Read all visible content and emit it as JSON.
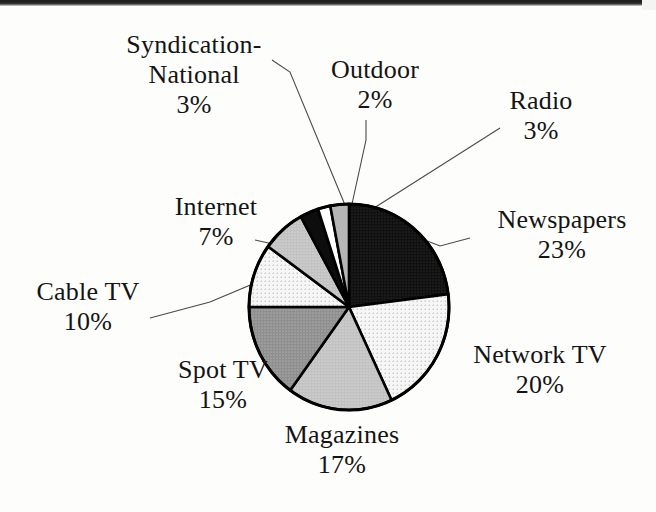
{
  "chart_data": {
    "type": "pie",
    "title": "",
    "subtitle": "",
    "xlabel": "",
    "ylabel": "",
    "legend_position": "none",
    "grid": false,
    "labels_show_percent": true,
    "start_angle_deg": 0,
    "direction": "clockwise",
    "categories": [
      "Newspapers",
      "Network TV",
      "Magazines",
      "Spot TV",
      "Cable TV",
      "Internet",
      "Syndication-National",
      "Outdoor",
      "Radio"
    ],
    "values": [
      23,
      20,
      17,
      15,
      10,
      7,
      3,
      2,
      3
    ],
    "unit": "%",
    "slices": [
      {
        "label": "Newspapers",
        "value": 23,
        "percent_text": "23%",
        "fill": "#161616",
        "pattern": "dense-dot-dark"
      },
      {
        "label": "Network TV",
        "value": 20,
        "percent_text": "20%",
        "fill": "#f2f2f2",
        "pattern": "sparse-dot-light"
      },
      {
        "label": "Magazines",
        "value": 17,
        "percent_text": "17%",
        "fill": "#b9b9b9",
        "pattern": "dot-midlight"
      },
      {
        "label": "Spot TV",
        "value": 15,
        "percent_text": "15%",
        "fill": "#8e8e8e",
        "pattern": "dot-mid"
      },
      {
        "label": "Cable TV",
        "value": 10,
        "percent_text": "10%",
        "fill": "#eeeeee",
        "pattern": "sparse-dot-light"
      },
      {
        "label": "Internet",
        "value": 7,
        "percent_text": "7%",
        "fill": "#bcbcbc",
        "pattern": "dot-midlight"
      },
      {
        "label": "Syndication-National",
        "value": 3,
        "percent_text": "3%",
        "fill": "#101010",
        "pattern": "solid-black"
      },
      {
        "label": "Outdoor",
        "value": 2,
        "percent_text": "2%",
        "fill": "#ffffff",
        "pattern": "solid-white"
      },
      {
        "label": "Radio",
        "value": 3,
        "percent_text": "3%",
        "fill": "#b5b5b5",
        "pattern": "solid-gray"
      }
    ]
  },
  "labels": {
    "syndication": {
      "line1": "Syndication-",
      "line2": "National",
      "percent": "3%"
    },
    "outdoor": {
      "line1": "Outdoor",
      "percent": "2%"
    },
    "radio": {
      "line1": "Radio",
      "percent": "3%"
    },
    "newspapers": {
      "line1": "Newspapers",
      "percent": "23%"
    },
    "networktv": {
      "line1": "Network TV",
      "percent": "20%"
    },
    "magazines": {
      "line1": "Magazines",
      "percent": "17%"
    },
    "spottv": {
      "line1": "Spot TV",
      "percent": "15%"
    },
    "cabletv": {
      "line1": "Cable TV",
      "percent": "10%"
    },
    "internet": {
      "line1": "Internet",
      "percent": "7%"
    }
  },
  "colors": {
    "background": "#fdfdfb",
    "text": "#141414",
    "outline": "#000000",
    "leader_line": "#4a4a4a"
  }
}
